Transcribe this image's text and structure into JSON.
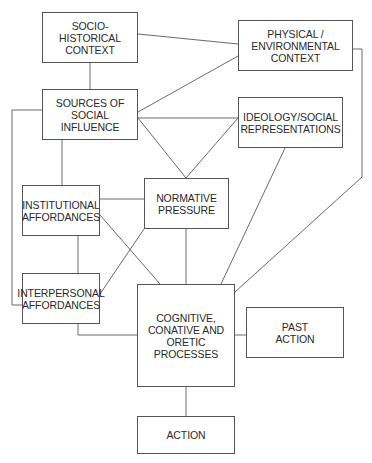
{
  "diagram": {
    "nodes": [
      {
        "id": "socio_historical",
        "label": "SOCIO-HISTORICAL\nCONTEXT",
        "x": 42,
        "y": 12,
        "w": 96,
        "h": 51
      },
      {
        "id": "physical",
        "label": "PHYSICAL /\nENVIRONMENTAL\nCONTEXT",
        "x": 238,
        "y": 20,
        "w": 115,
        "h": 51
      },
      {
        "id": "sources",
        "label": "SOURCES OF SOCIAL\nINFLUENCE",
        "x": 42,
        "y": 89,
        "w": 96,
        "h": 51
      },
      {
        "id": "ideology",
        "label": "IDEOLOGY/SOCIAL\nREPRESENTATIONS",
        "x": 238,
        "y": 97,
        "w": 105,
        "h": 51
      },
      {
        "id": "institutional",
        "label": "INSTITUTIONAL\nAFFORDANCES",
        "x": 22,
        "y": 185,
        "w": 78,
        "h": 51
      },
      {
        "id": "normative",
        "label": "NORMATIVE\nPRESSURE",
        "x": 144,
        "y": 178,
        "w": 85,
        "h": 51
      },
      {
        "id": "interpersonal",
        "label": "INTERPERSONAL\nAFFORDANCES",
        "x": 22,
        "y": 273,
        "w": 78,
        "h": 51
      },
      {
        "id": "cognitive",
        "label": "COGNITIVE,\nCONATIVE AND\nORETIC\nPROCESSES",
        "x": 137,
        "y": 284,
        "w": 98,
        "h": 103
      },
      {
        "id": "past_action",
        "label": "PAST\nACTION",
        "x": 246,
        "y": 307,
        "w": 98,
        "h": 51
      },
      {
        "id": "action",
        "label": "ACTION",
        "x": 137,
        "y": 416,
        "w": 98,
        "h": 38
      }
    ],
    "edges": [
      {
        "from": "socio_historical",
        "to": "sources",
        "points": [
          [
            90,
            63
          ],
          [
            90,
            89
          ]
        ]
      },
      {
        "from": "socio_historical",
        "to": "physical",
        "points": [
          [
            138,
            34
          ],
          [
            238,
            44
          ]
        ]
      },
      {
        "from": "sources",
        "to": "physical",
        "points": [
          [
            138,
            112
          ],
          [
            238,
            56
          ]
        ]
      },
      {
        "from": "sources",
        "to": "ideology",
        "points": [
          [
            138,
            118
          ],
          [
            238,
            118
          ]
        ]
      },
      {
        "from": "sources",
        "to": "normative",
        "points": [
          [
            138,
            118
          ],
          [
            186,
            178
          ]
        ]
      },
      {
        "from": "ideology",
        "to": "normative",
        "points": [
          [
            238,
            118
          ],
          [
            186,
            178
          ]
        ]
      },
      {
        "from": "sources",
        "to": "institutional",
        "points": [
          [
            62,
            140
          ],
          [
            62,
            185
          ]
        ]
      },
      {
        "from": "sources",
        "to": "interpersonal",
        "points": [
          [
            42,
            110
          ],
          [
            12,
            110
          ],
          [
            12,
            305
          ],
          [
            22,
            305
          ]
        ]
      },
      {
        "from": "institutional",
        "to": "normative",
        "points": [
          [
            100,
            199
          ],
          [
            144,
            199
          ]
        ]
      },
      {
        "from": "institutional",
        "to": "interpersonal",
        "points": [
          [
            78,
            236
          ],
          [
            78,
            273
          ]
        ]
      },
      {
        "from": "institutional",
        "to": "cognitive",
        "points": [
          [
            100,
            215
          ],
          [
            160,
            284
          ]
        ]
      },
      {
        "from": "interpersonal",
        "to": "normative",
        "points": [
          [
            100,
            294
          ],
          [
            144,
            229
          ]
        ]
      },
      {
        "from": "interpersonal",
        "to": "cognitive",
        "points": [
          [
            78,
            324
          ],
          [
            78,
            335
          ],
          [
            137,
            335
          ]
        ]
      },
      {
        "from": "normative",
        "to": "cognitive",
        "points": [
          [
            186,
            229
          ],
          [
            186,
            284
          ]
        ]
      },
      {
        "from": "ideology",
        "to": "cognitive",
        "points": [
          [
            285,
            148
          ],
          [
            221,
            284
          ]
        ]
      },
      {
        "from": "physical",
        "to": "cognitive",
        "points": [
          [
            353,
            49
          ],
          [
            362,
            49
          ],
          [
            362,
            177
          ],
          [
            235,
            292
          ]
        ]
      },
      {
        "from": "cognitive",
        "to": "past_action",
        "points": [
          [
            235,
            335
          ],
          [
            246,
            335
          ]
        ]
      },
      {
        "from": "cognitive",
        "to": "action",
        "points": [
          [
            186,
            387
          ],
          [
            186,
            416
          ]
        ]
      }
    ],
    "colors": {
      "line": "#6a6a6a",
      "border": "#555555",
      "text": "#2a2a2a",
      "background": "#ffffff"
    }
  }
}
